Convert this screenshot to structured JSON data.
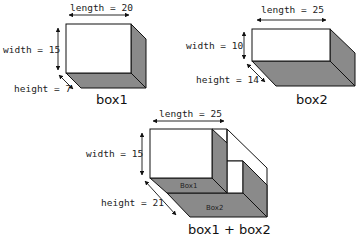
{
  "colors": {
    "shade": "#8a8a8a",
    "stroke": "#111111",
    "face": "#ffffff"
  },
  "box1": {
    "caption": "box1",
    "length_label": "length = 20",
    "width_label": "width = 15",
    "height_label": "height = 7",
    "length": 20,
    "width": 15,
    "height": 7
  },
  "box2": {
    "caption": "box2",
    "length_label": "length = 25",
    "width_label": "width = 10",
    "height_label": "height = 14",
    "length": 25,
    "width": 10,
    "height": 14
  },
  "combined": {
    "caption": "box1 + box2",
    "length_label": "length = 25",
    "width_label": "width = 15",
    "height_label": "height = 21",
    "inner_label_1": "Box1",
    "inner_label_2": "Box2",
    "length": 25,
    "width": 15,
    "height": 21
  }
}
